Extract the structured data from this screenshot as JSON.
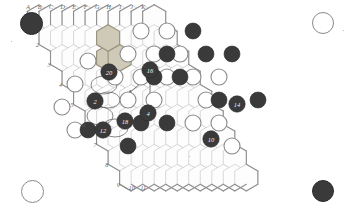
{
  "diagram": {
    "board_shape": "rhombus",
    "colors": {
      "grid_line": "#c9c9c9",
      "border_line": "#8f8f8f",
      "black_stone": "#3a3a3a",
      "white_stone": "#ffffff",
      "white_stone_edge": "#8a8a8a",
      "highlight_fill": "#cfc9b8",
      "highlight_edge": "#9a937f",
      "label_text": "#5f5f5f",
      "stone_number_text": "#f2f2f2",
      "annotation": "#6a6a6a",
      "background": "#ffffff"
    },
    "edge_labels_letters": [
      "A",
      "B",
      "C",
      "D",
      "E",
      "F",
      "G",
      "H",
      "I",
      "J",
      "K"
    ],
    "edge_labels_numbers": [
      "1",
      "2",
      "3",
      "4",
      "5",
      "6",
      "7",
      "8",
      "9",
      "10",
      "11"
    ],
    "corner_markers": [
      {
        "name": "top-left-marker",
        "color": "black"
      },
      {
        "name": "top-right-marker",
        "color": "white"
      },
      {
        "name": "bottom-left-marker",
        "color": "white"
      },
      {
        "name": "bottom-right-marker",
        "color": "black"
      }
    ],
    "highlighted_cells": [
      {
        "col": 4,
        "row": 2
      },
      {
        "col": 5,
        "row": 2
      },
      {
        "col": 5,
        "row": 1
      }
    ],
    "numbered_stones": [
      {
        "label": "20",
        "color": "black",
        "x": 109,
        "y": 72
      },
      {
        "label": "16",
        "color": "black",
        "x": 150,
        "y": 70
      },
      {
        "label": "2",
        "color": "black",
        "x": 95,
        "y": 101
      },
      {
        "label": "4",
        "color": "black",
        "x": 148,
        "y": 113
      },
      {
        "label": "18",
        "color": "black",
        "x": 125,
        "y": 121
      },
      {
        "label": "12",
        "color": "black",
        "x": 103,
        "y": 130
      },
      {
        "label": "14",
        "color": "black",
        "x": 237,
        "y": 104
      },
      {
        "label": "10",
        "color": "black",
        "x": 211,
        "y": 139
      }
    ],
    "plain_stones": [
      {
        "color": "white",
        "x": 75,
        "y": 84
      },
      {
        "color": "white",
        "x": 88,
        "y": 61
      },
      {
        "color": "white",
        "x": 62,
        "y": 107
      },
      {
        "color": "white",
        "x": 75,
        "y": 130
      },
      {
        "color": "white",
        "x": 128,
        "y": 54
      },
      {
        "color": "white",
        "x": 141,
        "y": 31
      },
      {
        "color": "white",
        "x": 154,
        "y": 54
      },
      {
        "color": "white",
        "x": 167,
        "y": 31
      },
      {
        "color": "white",
        "x": 180,
        "y": 54
      },
      {
        "color": "white",
        "x": 115,
        "y": 77
      },
      {
        "color": "white",
        "x": 128,
        "y": 100
      },
      {
        "color": "white",
        "x": 141,
        "y": 77
      },
      {
        "color": "white",
        "x": 167,
        "y": 77
      },
      {
        "color": "white",
        "x": 154,
        "y": 100
      },
      {
        "color": "white",
        "x": 193,
        "y": 77
      },
      {
        "color": "white",
        "x": 206,
        "y": 100
      },
      {
        "color": "white",
        "x": 193,
        "y": 123
      },
      {
        "color": "white",
        "x": 219,
        "y": 123
      },
      {
        "color": "white",
        "x": 232,
        "y": 146
      },
      {
        "color": "white",
        "x": 219,
        "y": 77
      },
      {
        "color": "black",
        "x": 193,
        "y": 31
      },
      {
        "color": "black",
        "x": 206,
        "y": 54
      },
      {
        "color": "black",
        "x": 232,
        "y": 54
      },
      {
        "color": "black",
        "x": 167,
        "y": 54
      },
      {
        "color": "black",
        "x": 180,
        "y": 77
      },
      {
        "color": "black",
        "x": 154,
        "y": 77
      },
      {
        "color": "black",
        "x": 219,
        "y": 100
      },
      {
        "color": "black",
        "x": 258,
        "y": 100
      },
      {
        "color": "black",
        "x": 141,
        "y": 123
      },
      {
        "color": "black",
        "x": 167,
        "y": 123
      },
      {
        "color": "black",
        "x": 88,
        "y": 130
      },
      {
        "color": "black",
        "x": 128,
        "y": 146
      }
    ],
    "annotations": [
      {
        "name": "move-arrow-one",
        "from_x": 141,
        "from_y": 83,
        "to_x": 129,
        "to_y": 93
      },
      {
        "name": "move-arrow-two",
        "from_x": 150,
        "from_y": 80,
        "to_x": 150,
        "to_y": 106
      },
      {
        "name": "loop-marker-one",
        "cx": 104,
        "cy": 85,
        "rx": 13,
        "ry": 9
      },
      {
        "name": "loop-marker-two",
        "cx": 100,
        "cy": 116,
        "rx": 13,
        "ry": 9
      },
      {
        "name": "loop-marker-three",
        "cx": 115,
        "cy": 128,
        "rx": 13,
        "ry": 9
      },
      {
        "name": "loop-marker-four",
        "cx": 108,
        "cy": 100,
        "rx": 12,
        "ry": 8
      }
    ]
  }
}
